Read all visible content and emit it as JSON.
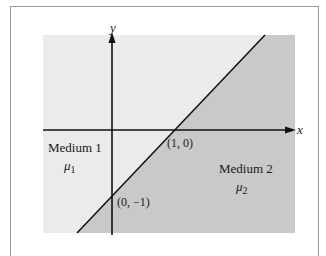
{
  "diagram": {
    "type": "two-region boundary plot",
    "axes": {
      "x_label": "x",
      "y_label": "y"
    },
    "boundary_line": {
      "equation": "y = x - 1",
      "points": [
        "(1, 0)",
        "(0, −1)"
      ]
    },
    "regions": [
      {
        "name": "Medium 1",
        "symbol": "μ",
        "subscript": "1",
        "color": "#ebebeb"
      },
      {
        "name": "Medium 2",
        "symbol": "μ",
        "subscript": "2",
        "color": "#c8c8c8"
      }
    ],
    "point_labels": {
      "p1": "(1, 0)",
      "p2": "(0, −1)"
    }
  }
}
